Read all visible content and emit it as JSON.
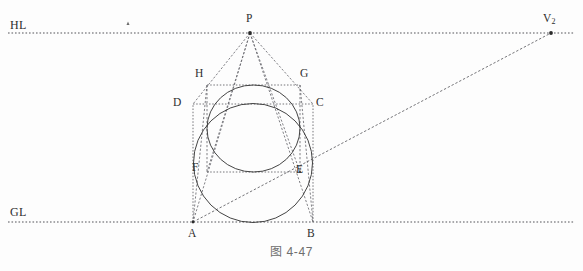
{
  "figure": {
    "caption": "图 4-47",
    "width": 583,
    "height": 271,
    "background_color": "#fdfdfd",
    "line_color": "#3a3a3a",
    "dotted_color": "#55555a",
    "label_color": "#2e2e2e",
    "caption_color": "#6e6e6e"
  },
  "labels": {
    "hl": "HL",
    "gl": "GL",
    "p": "P",
    "v2_letter": "V",
    "v2_sub": "2",
    "h": "H",
    "g": "G",
    "d": "D",
    "c": "C",
    "f": "F",
    "e": "E",
    "a": "A",
    "b": "B"
  },
  "label_positions": {
    "hl": {
      "x": 10,
      "y": 19
    },
    "gl": {
      "x": 10,
      "y": 206
    },
    "p": {
      "x": 246,
      "y": 13
    },
    "v2": {
      "x": 543,
      "y": 13
    },
    "h": {
      "x": 195,
      "y": 68
    },
    "g": {
      "x": 300,
      "y": 68
    },
    "d": {
      "x": 173,
      "y": 97
    },
    "c": {
      "x": 316,
      "y": 97
    },
    "f": {
      "x": 192,
      "y": 162
    },
    "e": {
      "x": 296,
      "y": 164
    },
    "a": {
      "x": 188,
      "y": 228
    },
    "b": {
      "x": 307,
      "y": 228
    }
  },
  "geometry": {
    "hl_line": {
      "x1": 8,
      "y1": 33,
      "x2": 575,
      "y2": 33
    },
    "gl_line": {
      "x1": 8,
      "y1": 222,
      "x2": 575,
      "y2": 222
    },
    "points": {
      "P": {
        "x": 250,
        "y": 33
      },
      "V2": {
        "x": 551,
        "y": 33
      },
      "A": {
        "x": 193,
        "y": 222
      },
      "B": {
        "x": 313,
        "y": 222
      },
      "C": {
        "x": 313,
        "y": 104
      },
      "D": {
        "x": 193,
        "y": 104
      },
      "E": {
        "x": 300,
        "y": 172
      },
      "F": {
        "x": 207,
        "y": 172
      },
      "G": {
        "x": 300,
        "y": 85
      },
      "H": {
        "x": 207,
        "y": 85
      },
      "mark": {
        "x": 128,
        "y": 23
      }
    },
    "front_square": {
      "x": 193,
      "y": 104,
      "w": 120,
      "h": 118
    },
    "back_square": {
      "x": 207,
      "y": 85,
      "w": 93,
      "h": 87
    },
    "front_circle": {
      "cx": 253,
      "cy": 163,
      "r": 59.5
    },
    "back_circle": {
      "cx": 253.5,
      "cy": 128.5,
      "rx": 46.5,
      "ry": 43.5
    },
    "perspective_rays_from_P": [
      "A",
      "B",
      "D",
      "C",
      "F",
      "E",
      "H",
      "G"
    ],
    "diagonal_to_V2": {
      "from": "A",
      "to": "V2"
    }
  }
}
